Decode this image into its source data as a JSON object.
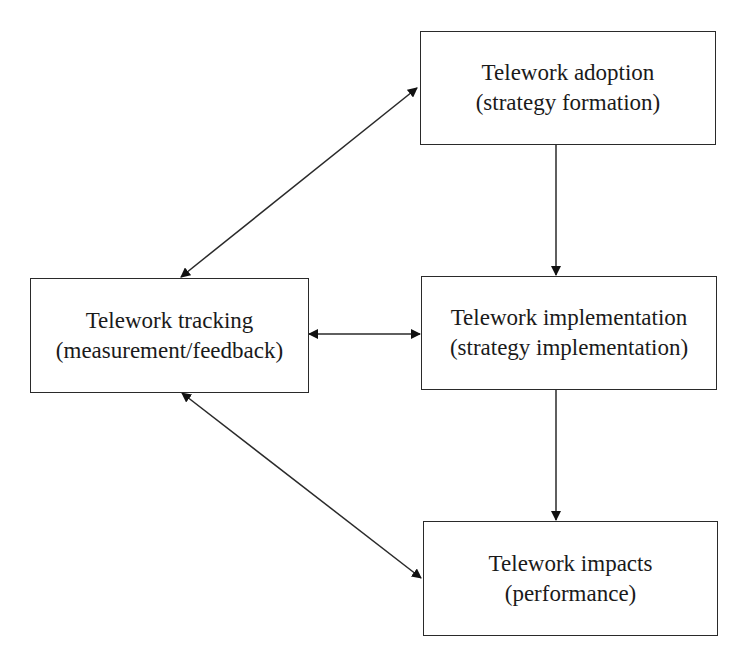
{
  "diagram": {
    "nodes": [
      {
        "id": "adoption",
        "title": "Telework adoption",
        "subtitle": "(strategy formation)"
      },
      {
        "id": "tracking",
        "title": "Telework tracking",
        "subtitle": "(measurement/feedback)"
      },
      {
        "id": "implementation",
        "title": "Telework implementation",
        "subtitle": "(strategy implementation)"
      },
      {
        "id": "impacts",
        "title": "Telework impacts",
        "subtitle": "(performance)"
      }
    ],
    "edges": [
      {
        "from": "adoption",
        "to": "implementation",
        "type": "one-way"
      },
      {
        "from": "implementation",
        "to": "impacts",
        "type": "one-way"
      },
      {
        "from": "tracking",
        "to": "implementation",
        "type": "two-way"
      },
      {
        "from": "tracking",
        "to": "adoption",
        "type": "two-way"
      },
      {
        "from": "tracking",
        "to": "impacts",
        "type": "two-way"
      }
    ],
    "colors": {
      "line": "#2a2a2a",
      "background": "#ffffff"
    }
  }
}
